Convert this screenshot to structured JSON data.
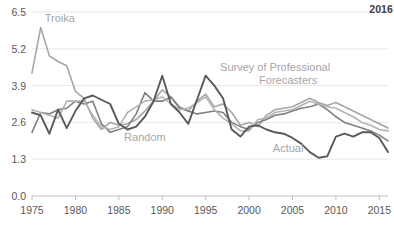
{
  "chart_data": {
    "type": "line",
    "title": "",
    "subtitle": "",
    "xlabel": "",
    "ylabel": "",
    "xlim": [
      1975,
      2016
    ],
    "ylim": [
      0.0,
      6.5
    ],
    "grid": true,
    "legend_position": "inline-annotations",
    "ytick_labels": [
      "6.5",
      "5.2",
      "3.9",
      "2.6",
      "1.3",
      "0.0"
    ],
    "ytick_values": [
      6.5,
      5.2,
      3.9,
      2.6,
      1.3,
      0.0
    ],
    "xtick_labels": [
      "1975",
      "1980",
      "1985",
      "1990",
      "1995",
      "2000",
      "2005",
      "2010",
      "2015"
    ],
    "xtick_values": [
      1975,
      1980,
      1985,
      1990,
      1995,
      2000,
      2005,
      2010,
      2015
    ],
    "corner_annotation": "2016",
    "x": [
      1975,
      1976,
      1977,
      1978,
      1979,
      1980,
      1981,
      1982,
      1983,
      1984,
      1985,
      1986,
      1987,
      1988,
      1989,
      1990,
      1991,
      1992,
      1993,
      1994,
      1995,
      1996,
      1997,
      1998,
      1999,
      2000,
      2001,
      2002,
      2003,
      2004,
      2005,
      2006,
      2007,
      2008,
      2009,
      2010,
      2011,
      2012,
      2013,
      2014,
      2015,
      2016
    ],
    "series": [
      {
        "name": "Troika",
        "label": "Troika",
        "color": "#a6a6a6",
        "stroke_width": 1.6,
        "label_x": 1978.2,
        "label_y": 6.15,
        "values": [
          4.35,
          5.95,
          4.95,
          4.75,
          4.6,
          3.7,
          3.45,
          2.75,
          2.35,
          2.6,
          2.5,
          2.55,
          2.7,
          3.0,
          3.35,
          3.75,
          3.5,
          3.15,
          3.0,
          3.35,
          3.6,
          3.15,
          3.25,
          2.95,
          2.5,
          2.6,
          2.45,
          2.85,
          3.05,
          3.1,
          3.15,
          3.3,
          3.45,
          3.3,
          3.2,
          3.3,
          3.15,
          3.0,
          2.85,
          2.7,
          2.55,
          2.4
        ]
      },
      {
        "name": "Random",
        "label": "Random",
        "color": "#808080",
        "stroke_width": 1.6,
        "label_x": 1988.0,
        "label_y": 1.95,
        "values": [
          2.25,
          2.95,
          2.9,
          3.05,
          3.1,
          3.35,
          3.25,
          3.35,
          2.55,
          2.25,
          2.35,
          2.45,
          2.9,
          3.65,
          3.35,
          3.35,
          3.5,
          3.1,
          3.0,
          2.9,
          2.95,
          3.0,
          2.95,
          2.6,
          2.45,
          2.35,
          2.6,
          2.7,
          2.85,
          2.9,
          3.0,
          3.1,
          3.15,
          3.25,
          3.05,
          2.8,
          2.6,
          2.5,
          2.4,
          2.3,
          2.15,
          1.95
        ]
      },
      {
        "name": "Survey of Professional Forecasters",
        "label": "Survey of Professional Forecasters",
        "color": "#b3b3b3",
        "stroke_width": 1.6,
        "label_x": 2003.0,
        "label_y": 4.25,
        "values": [
          3.05,
          2.95,
          2.85,
          2.75,
          3.35,
          3.35,
          3.35,
          2.85,
          2.45,
          2.35,
          2.45,
          2.95,
          3.15,
          3.35,
          3.4,
          3.5,
          3.25,
          3.05,
          3.1,
          3.3,
          3.5,
          3.05,
          2.75,
          2.55,
          2.3,
          2.3,
          2.7,
          2.75,
          2.95,
          3.0,
          3.05,
          3.2,
          3.35,
          3.25,
          3.15,
          3.1,
          2.95,
          2.8,
          2.6,
          2.5,
          2.35,
          2.3
        ]
      },
      {
        "name": "Actual",
        "label": "Actual",
        "color": "#595959",
        "stroke_width": 1.9,
        "label_x": 2004.5,
        "label_y": 1.55,
        "values": [
          2.95,
          2.85,
          2.2,
          3.05,
          2.4,
          3.0,
          3.45,
          3.55,
          3.4,
          3.25,
          2.55,
          2.35,
          2.45,
          2.8,
          3.35,
          4.25,
          3.25,
          2.95,
          2.55,
          3.4,
          4.25,
          3.9,
          3.45,
          2.35,
          2.1,
          2.45,
          2.5,
          2.35,
          2.25,
          2.2,
          2.05,
          1.85,
          1.55,
          1.35,
          1.4,
          2.1,
          2.2,
          2.1,
          2.25,
          2.25,
          2.05,
          1.55
        ]
      }
    ],
    "annotations": [
      {
        "text": "Troika",
        "x": 1978.2,
        "y": 6.15
      },
      {
        "text": "Random",
        "x": 1988.0,
        "y": 1.95
      },
      {
        "text": "Survey of Professional",
        "x": 2003.0,
        "y": 4.4
      },
      {
        "text": "Forecasters",
        "x": 2004.5,
        "y": 3.95
      },
      {
        "text": "Actual",
        "x": 2004.5,
        "y": 1.55
      },
      {
        "text": "2016",
        "x": 2015.2,
        "y": 6.45
      }
    ]
  },
  "plot_geometry": {
    "left": 32,
    "right": 388,
    "top": 12,
    "bottom": 196
  },
  "colors": {
    "gridline": "#e8e8e8",
    "axis": "#bfbfbf",
    "tick_text": "#595959",
    "annotation_text": "#a6a6a6",
    "corner_text": "#404040",
    "background": "#ffffff"
  }
}
